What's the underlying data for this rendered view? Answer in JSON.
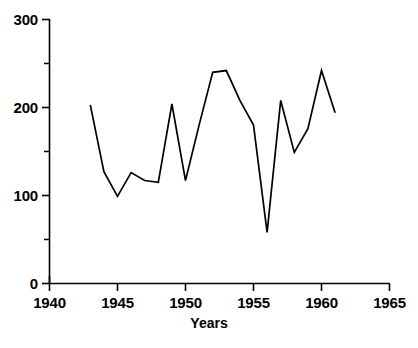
{
  "chart_data": {
    "type": "line",
    "title": "",
    "xlabel": "Years",
    "ylabel": "",
    "x": [
      1943,
      1944,
      1945,
      1946,
      1947,
      1948,
      1949,
      1950,
      1951,
      1952,
      1953,
      1954,
      1955,
      1956,
      1957,
      1958,
      1959,
      1960,
      1961
    ],
    "values": [
      203,
      127,
      99,
      126,
      117,
      115,
      204,
      117,
      180,
      240,
      242,
      208,
      180,
      58,
      208,
      149,
      176,
      242,
      194
    ],
    "series": [
      {
        "name": "series-1",
        "values": [
          203,
          127,
          99,
          126,
          117,
          115,
          204,
          117,
          180,
          240,
          242,
          208,
          180,
          58,
          208,
          149,
          176,
          242,
          194
        ]
      }
    ],
    "xlim": [
      1940,
      1965
    ],
    "ylim": [
      0,
      300
    ],
    "x_ticks": [
      1940,
      1945,
      1950,
      1955,
      1960,
      1965
    ],
    "x_tick_labels": [
      "1940",
      "1945",
      "1950",
      "1955",
      "1960",
      "1965"
    ],
    "x_minor_tick_step": 5,
    "y_ticks": [
      0,
      100,
      200,
      300
    ],
    "y_tick_labels": [
      "0",
      "100",
      "200",
      "300"
    ],
    "y_minor_ticks": [
      50,
      150,
      250
    ],
    "grid": false,
    "legend": false,
    "line_color": "#000000",
    "axis_color": "#000000",
    "background_color": "#ffffff"
  },
  "axis_titles": {
    "x": "Years"
  },
  "y_axis": {
    "labels": [
      "300",
      "200",
      "100",
      "0"
    ]
  },
  "x_axis": {
    "labels": [
      "1940",
      "1945",
      "1950",
      "1955",
      "1960",
      "1965"
    ]
  }
}
